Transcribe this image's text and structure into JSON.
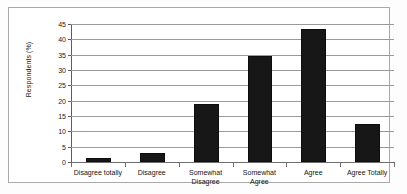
{
  "chart_data": {
    "type": "bar",
    "title": "",
    "subtitle": "",
    "xlabel": "",
    "ylabel": "Respondents (%)",
    "ylim": [
      0,
      45
    ],
    "ytick_step": 5,
    "yticks": [
      "45",
      "40",
      "35",
      "30",
      "25",
      "20",
      "15",
      "10",
      "5",
      "0"
    ],
    "grid": true,
    "legend": false,
    "categories": [
      "Disagree totally",
      "Disagree",
      "Somewhat Disagree",
      "Somewhat Agree",
      "Agree",
      "Agree Totally"
    ],
    "category_lines": [
      [
        "Disagree totally"
      ],
      [
        "Disagree"
      ],
      [
        "Somewhat",
        "Disagree"
      ],
      [
        "Somewhat",
        "Agree"
      ],
      [
        "Agree"
      ],
      [
        "Agree Totally"
      ]
    ],
    "values": [
      1.3,
      2.8,
      18.8,
      34.5,
      43.3,
      12.4
    ],
    "colors": {
      "bar": "#171717",
      "gridline": "#9a9a9a",
      "axis": "#5d5d5d",
      "frame": "#a9a9a9",
      "background": "#ffffff",
      "text": "#141414"
    }
  }
}
